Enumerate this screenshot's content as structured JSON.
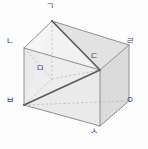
{
  "figure": {
    "canvas": {
      "width": 148,
      "height": 149,
      "background": "#fdfdfd"
    },
    "style": {
      "outline_color": "#8d8d8d",
      "hidden_edge_color": "#b6b6b6",
      "section_edge_color": "#5a5a5a",
      "face_front": "#e9e9e9",
      "face_right": "#dcdcdc",
      "face_roof_left": "#f4f4f4",
      "face_roof_right": "#e3e3e3",
      "face_top_cut": "#efefef",
      "label_color": "#4a4a4a"
    },
    "vertices": [
      {
        "id": "v1",
        "label": "ㄱ",
        "role": "apex-back-top",
        "x": 52,
        "y": 21,
        "label_x": 46,
        "label_y": 2,
        "hidden": false
      },
      {
        "id": "v2",
        "label": "ㄴ",
        "role": "front-left-top",
        "x": 24,
        "y": 48,
        "label_x": 6,
        "label_y": 37,
        "hidden": false
      },
      {
        "id": "v3",
        "label": "ㄷ",
        "role": "eave-right",
        "x": 100,
        "y": 70,
        "label_x": 90,
        "label_y": 52,
        "hidden": false
      },
      {
        "id": "v4",
        "label": "ㄹ",
        "role": "back-right-top",
        "x": 129,
        "y": 45,
        "label_x": 126,
        "label_y": 37,
        "hidden": false
      },
      {
        "id": "v5",
        "label": "ㅁ",
        "role": "hidden-inner",
        "x": 52,
        "y": 79,
        "label_x": 36,
        "label_y": 64,
        "hidden": true
      },
      {
        "id": "v6",
        "label": "ㅂ",
        "role": "front-left-base",
        "x": 24,
        "y": 105,
        "label_x": 6,
        "label_y": 96,
        "hidden": false
      },
      {
        "id": "v7",
        "label": "ㅅ",
        "role": "front-right-base",
        "x": 100,
        "y": 126,
        "label_x": 90,
        "label_y": 127,
        "hidden": false
      },
      {
        "id": "v8",
        "label": "ㅇ",
        "role": "back-right-base",
        "x": 129,
        "y": 101,
        "label_x": 126,
        "label_y": 96,
        "hidden": false
      }
    ],
    "edges": [
      {
        "from": "ㄱ",
        "to": "ㄴ",
        "kind": "solid"
      },
      {
        "from": "ㄱ",
        "to": "ㄹ",
        "kind": "solid"
      },
      {
        "from": "ㄴ",
        "to": "ㅂ",
        "kind": "solid"
      },
      {
        "from": "ㄹ",
        "to": "ㅇ",
        "kind": "solid"
      },
      {
        "from": "ㄴ",
        "to": "ㄷ",
        "kind": "solid"
      },
      {
        "from": "ㄷ",
        "to": "ㄹ",
        "kind": "solid"
      },
      {
        "from": "ㄷ",
        "to": "ㅅ",
        "kind": "solid"
      },
      {
        "from": "ㅂ",
        "to": "ㅅ",
        "kind": "solid"
      },
      {
        "from": "ㅅ",
        "to": "ㅇ",
        "kind": "solid"
      },
      {
        "from": "ㄱ",
        "to": "ㅁ",
        "kind": "hidden"
      },
      {
        "from": "ㅁ",
        "to": "ㄴ",
        "kind": "hidden"
      },
      {
        "from": "ㅁ",
        "to": "ㅂ",
        "kind": "hidden"
      },
      {
        "from": "ㅁ",
        "to": "ㄷ",
        "kind": "hidden"
      },
      {
        "from": "ㅂ",
        "to": "ㅇ",
        "kind": "hidden"
      },
      {
        "from": "ㄱ",
        "to": "ㄷ",
        "kind": "section"
      },
      {
        "from": "ㄷ",
        "to": "ㅂ",
        "kind": "section"
      }
    ],
    "section": {
      "name": "triangular-cross-section",
      "vertices": [
        "ㄱ",
        "ㄷ",
        "ㅂ"
      ],
      "emphasis": "dark"
    }
  }
}
